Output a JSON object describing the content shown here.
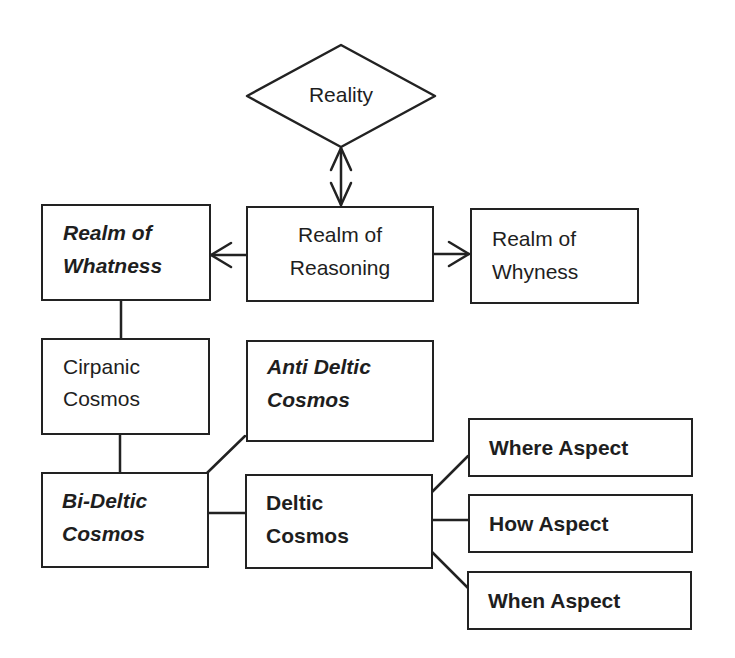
{
  "diagram": {
    "nodes": {
      "reality": {
        "label": "Reality",
        "shape": "diamond"
      },
      "realm_whatness": {
        "lines": [
          "Realm of",
          "Whatness"
        ],
        "style": "bold-italic"
      },
      "realm_reasoning": {
        "lines": [
          "Realm of",
          "Reasoning"
        ],
        "style": "normal"
      },
      "realm_whyness": {
        "lines": [
          "Realm of",
          "Whyness"
        ],
        "style": "normal"
      },
      "cirpanic_cosmos": {
        "lines": [
          "Cirpanic",
          "Cosmos"
        ],
        "style": "normal"
      },
      "anti_deltic_cosmos": {
        "lines": [
          "Anti Deltic",
          "Cosmos"
        ],
        "style": "bold-italic"
      },
      "bi_deltic_cosmos": {
        "lines": [
          "Bi-Deltic",
          "Cosmos"
        ],
        "style": "bold-italic"
      },
      "deltic_cosmos": {
        "lines": [
          "Deltic",
          "Cosmos"
        ],
        "style": "bold"
      },
      "where_aspect": {
        "label": "Where Aspect",
        "style": "bold"
      },
      "how_aspect": {
        "label": "How Aspect",
        "style": "bold"
      },
      "when_aspect": {
        "label": "When Aspect",
        "style": "bold"
      }
    },
    "edges": [
      {
        "from": "reality",
        "to": "realm_reasoning",
        "type": "bidirectional-arrow"
      },
      {
        "from": "realm_reasoning",
        "to": "realm_whatness",
        "type": "arrow"
      },
      {
        "from": "realm_reasoning",
        "to": "realm_whyness",
        "type": "arrow"
      },
      {
        "from": "realm_whatness",
        "to": "cirpanic_cosmos",
        "type": "line"
      },
      {
        "from": "cirpanic_cosmos",
        "to": "bi_deltic_cosmos",
        "type": "line"
      },
      {
        "from": "bi_deltic_cosmos",
        "to": "anti_deltic_cosmos",
        "type": "line"
      },
      {
        "from": "bi_deltic_cosmos",
        "to": "deltic_cosmos",
        "type": "line"
      },
      {
        "from": "deltic_cosmos",
        "to": "where_aspect",
        "type": "line"
      },
      {
        "from": "deltic_cosmos",
        "to": "how_aspect",
        "type": "line"
      },
      {
        "from": "deltic_cosmos",
        "to": "when_aspect",
        "type": "line"
      }
    ],
    "colors": {
      "stroke": "#222222",
      "background": "#ffffff",
      "text": "#1e1e1e"
    }
  }
}
